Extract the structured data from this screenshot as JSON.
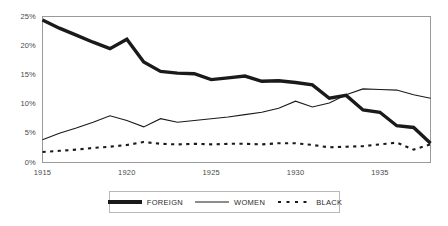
{
  "chart_data": {
    "type": "line",
    "title": "",
    "subtitle": "",
    "xlabel": "",
    "ylabel": "",
    "xlim": [
      1915,
      1938
    ],
    "ylim": [
      0,
      25
    ],
    "grid": false,
    "legend_position": "bottom-center",
    "y_tick_labels": [
      "0%",
      "5%",
      "10%",
      "15%",
      "20%",
      "25%"
    ],
    "y_tick_values": [
      0,
      5,
      10,
      15,
      20,
      25
    ],
    "x_tick_labels": [
      "1915",
      "1920",
      "1925",
      "1930",
      "1935"
    ],
    "x_tick_values": [
      1915,
      1920,
      1925,
      1930,
      1935
    ],
    "x": [
      1915,
      1916,
      1917,
      1918,
      1919,
      1920,
      1921,
      1922,
      1923,
      1924,
      1925,
      1926,
      1927,
      1928,
      1929,
      1930,
      1931,
      1932,
      1933,
      1934,
      1935,
      1936,
      1937,
      1938
    ],
    "series": [
      {
        "name": "FOREIGN",
        "style": "thick-solid",
        "color": "#1a1a1a",
        "values": [
          24.4,
          23.0,
          21.8,
          20.6,
          19.5,
          21.1,
          17.2,
          15.6,
          15.3,
          15.2,
          14.2,
          14.5,
          14.8,
          13.9,
          14.0,
          13.7,
          13.3,
          11.0,
          11.5,
          9.0,
          8.6,
          6.3,
          6.0,
          3.3
        ]
      },
      {
        "name": "WOMEN",
        "style": "thin-solid",
        "color": "#1a1a1a",
        "values": [
          3.9,
          5.0,
          5.9,
          6.9,
          8.0,
          7.2,
          6.1,
          7.5,
          6.9,
          7.2,
          7.5,
          7.8,
          8.2,
          8.6,
          9.3,
          10.5,
          9.5,
          10.2,
          11.6,
          12.6,
          12.5,
          12.4,
          11.6,
          11.0
        ]
      },
      {
        "name": "BLACK",
        "style": "dashed",
        "color": "#1a1a1a",
        "values": [
          1.8,
          2.0,
          2.2,
          2.5,
          2.7,
          3.0,
          3.5,
          3.2,
          3.1,
          3.2,
          3.1,
          3.2,
          3.2,
          3.1,
          3.3,
          3.3,
          3.0,
          2.6,
          2.7,
          2.8,
          3.1,
          3.4,
          2.2,
          3.1
        ]
      }
    ]
  },
  "legend": {
    "items": [
      {
        "label": "FOREIGN"
      },
      {
        "label": "WOMEN"
      },
      {
        "label": "BLACK"
      }
    ]
  }
}
